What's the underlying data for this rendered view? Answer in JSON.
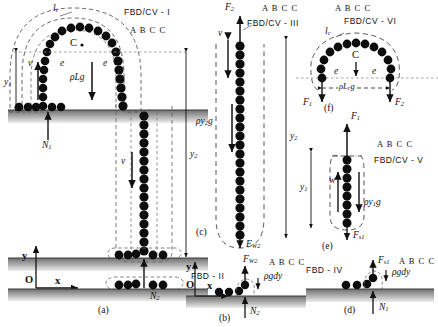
{
  "figure": {
    "title_caption_a": "(a)",
    "title_caption_b": "(b)",
    "title_caption_c": "(c)",
    "title_caption_d": "(d)",
    "title_caption_e": "(e)",
    "title_caption_f": "(f)"
  },
  "panel_a": {
    "fbd_label": "FBD/CV - I",
    "abcc": "A B C C",
    "lc_label": "l",
    "lc_sub": "c",
    "center_mark": "C",
    "e_left": "e",
    "e_right": "e",
    "weight_label": "ρLg",
    "v_left": "v",
    "v_right": "v",
    "y1": "y",
    "y1_sub": "1",
    "y2": "y",
    "y2_sub": "2",
    "N1": "N",
    "N1_sub": "1",
    "N2": "N",
    "N2_sub": "2",
    "axis_y": "y",
    "axis_x": "x",
    "axis_origin": "O",
    "caption": "(a)"
  },
  "panel_b": {
    "fbd_label": "FBD - II",
    "abcc": "A B C C",
    "Fw2": "F",
    "Fw2_sub": "W2",
    "rho_g_dy": "ρgdy",
    "N2": "N",
    "N2_sub": "2",
    "axis_y": "y",
    "axis_x": "x",
    "axis_origin": "O",
    "caption": "(b)"
  },
  "panel_c": {
    "fbd_label": "FBD/CV - III",
    "abcc": "A B C C",
    "F2": "F",
    "F2_sub": "2",
    "v": "v",
    "weight_label": "ρy",
    "weight_sub": "2",
    "weight_tail": "g",
    "y2": "y",
    "y2_sub": "2",
    "Fw2": "F",
    "Fw2_sub": "W2",
    "caption": "(c)"
  },
  "panel_d": {
    "fbd_label": "FBD - IV",
    "abcc": "A B C C",
    "Fs1": "F",
    "Fs1_sub": "s1",
    "rho_g_dy": "ρgdy",
    "N1": "N",
    "N1_sub": "1",
    "caption": "(d)"
  },
  "panel_e": {
    "fbd_label": "FBD/CV - V",
    "abcc": "A B C C",
    "F1": "F",
    "F1_sub": "1",
    "w": "w",
    "weight_label": "ρy",
    "weight_sub": "1",
    "weight_tail": "g",
    "y1": "y",
    "y1_sub": "1",
    "Fs1": "F",
    "Fs1_sub": "s1",
    "caption": "(e)"
  },
  "panel_f": {
    "fbd_label": "FBD/CV - VI",
    "abcc": "A B C C",
    "lc_label": "l",
    "lc_sub": "c",
    "center_mark": "C",
    "e_left": "e",
    "e_right": "e",
    "weight_label": "ρL",
    "weight_sub": "c",
    "weight_tail": "g",
    "F1": "F",
    "F1_sub": "1",
    "F2": "F",
    "F2_sub": "2",
    "caption": "(f)"
  },
  "colors": {
    "ink": "#111111",
    "chain": "#0d0d0d",
    "ground_dark": "#5a5a5a",
    "ground_light": "#d8d8d8",
    "dash": "#4a4a4a"
  }
}
